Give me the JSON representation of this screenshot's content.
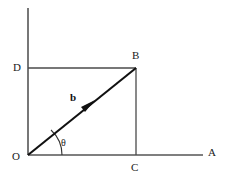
{
  "figure": {
    "background_color": "#ffffff",
    "width": 235,
    "height": 180,
    "axis_color": "#555555",
    "rect_color": "#4a4a4a",
    "vector_color": "#111111",
    "label_color": "#1a1a1a"
  },
  "labels": {
    "origin": "O",
    "x_axis_end": "A",
    "vector_tip": "B",
    "foot_x": "C",
    "foot_y": "D",
    "vector": "b",
    "angle": "θ"
  },
  "geometry": {
    "origin": {
      "x": 28,
      "y": 155
    },
    "point_A": {
      "x": 203,
      "y": 155
    },
    "point_B": {
      "x": 136,
      "y": 68
    },
    "point_C": {
      "x": 136,
      "y": 155
    },
    "point_D": {
      "x": 28,
      "y": 68
    },
    "y_axis_top": {
      "x": 28,
      "y": 8
    },
    "arrow_head": {
      "x": 88,
      "y": 107
    },
    "angle_arc_radius": 34
  }
}
